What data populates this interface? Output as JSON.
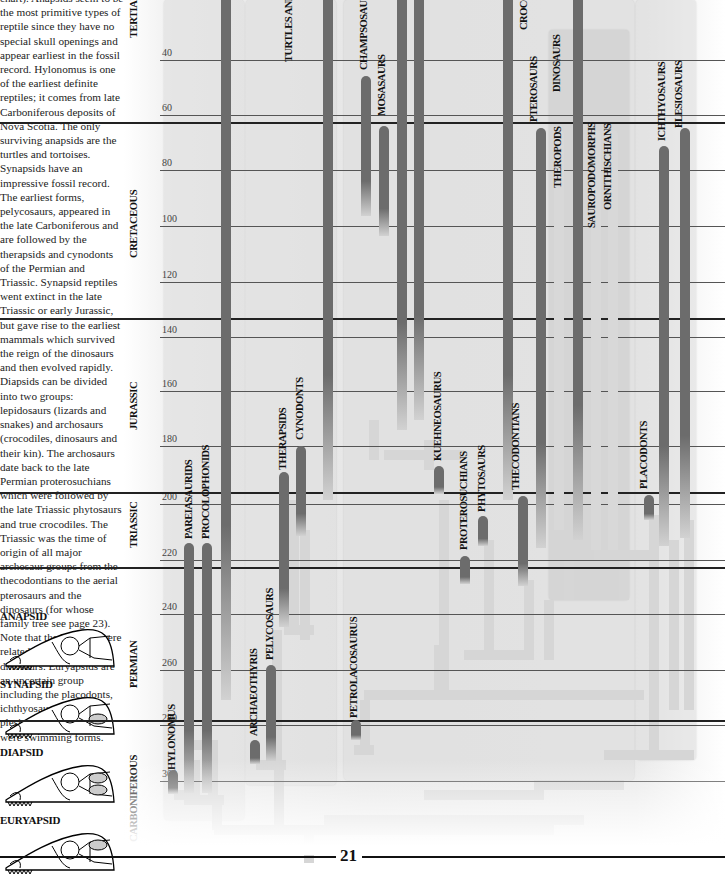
{
  "text": {
    "paragraphs": [
      "chart). Anapsids seem to be the most primitive types of reptile since they have no special skull openings and appear earliest in the fossil record. Hylonomus is one of the earliest definite reptiles; it comes from late Carboniferous deposits of Nova Scotia. The only surviving anapsids are the turtles and tortoises. Synapsids have an impressive fossil record. The earliest forms, pelycosaurs, appeared in the late Carboniferous and are followed by the therapsids and cynodonts of the Permian and Triassic. Synapsid reptiles went extinct in the late Triassic or early Jurassic, but gave rise to the earliest mammals which survived the reign of the dinosaurs and then evolved rapidly. Diapsids can be divided into two groups: lepidosaurs (lizards and snakes) and archosaurs (crocodiles, dinosaurs and their kin). The archosaurs date back to the late Permian proterosuchians which were followed by the late Triassic phytosaurs and true crocodiles. The Triassic was the time of origin of all major archosaur groups from the thecodontians to the aerial pterosaurs and the dinosaurs (for whose family tree see page 23). Note that the birds are here related to theropod dinosaurs. Euryapsids are an uncertain group including the placodonts, ichthyosaurs, and plesiosaurs, all of which were swimming forms."
    ]
  },
  "skulls": [
    {
      "label": "ANAPSID",
      "openings": 0
    },
    {
      "label": "SYNAPSID",
      "openings": 1
    },
    {
      "label": "DIAPSID",
      "openings": 2
    },
    {
      "label": "EURYAPSID",
      "openings": 1
    }
  ],
  "periods": [
    {
      "label": "TERTIARY",
      "y": 38
    },
    {
      "label": "CRETACEOUS",
      "y": 258
    },
    {
      "label": "JURASSIC",
      "y": 430
    },
    {
      "label": "TRIASSIC",
      "y": 548
    },
    {
      "label": "PERMIAN",
      "y": 688
    },
    {
      "label": "CARBONIFEROUS",
      "y": 842
    }
  ],
  "ticks": [
    {
      "label": "40",
      "y": 56
    },
    {
      "label": "60",
      "y": 111
    },
    {
      "label": "80",
      "y": 166
    },
    {
      "label": "100",
      "y": 222
    },
    {
      "label": "120",
      "y": 278
    },
    {
      "label": "140",
      "y": 333
    },
    {
      "label": "160",
      "y": 387
    },
    {
      "label": "180",
      "y": 442
    },
    {
      "label": "200",
      "y": 500
    },
    {
      "label": "220",
      "y": 556
    },
    {
      "label": "240",
      "y": 610
    },
    {
      "label": "260",
      "y": 666
    },
    {
      "label": "280",
      "y": 721
    },
    {
      "label": "300",
      "y": 777
    }
  ],
  "period_boundaries": [
    122,
    318,
    492,
    567,
    720
  ],
  "taxa": [
    {
      "label": "TURTLES AND",
      "x": 165,
      "labelTop": 62
    },
    {
      "label": "HYLONOMUS",
      "x": 48,
      "labelTop": 770
    },
    {
      "label": "PAREIASAURIDS",
      "x": 65,
      "labelTop": 539
    },
    {
      "label": "PROCOLOPHONIDS",
      "x": 82,
      "labelTop": 539
    },
    {
      "label": "ARCHAEOTHYRIS",
      "x": 130,
      "labelTop": 736
    },
    {
      "label": "PELYCOSAURS",
      "x": 146,
      "labelTop": 660
    },
    {
      "label": "THERAPSIDS",
      "x": 159,
      "labelTop": 470
    },
    {
      "label": "CYNODONTS",
      "x": 176,
      "labelTop": 440
    },
    {
      "label": "PETROLACOSAURUS",
      "x": 230,
      "labelTop": 718
    },
    {
      "label": "CHAMPSOSAURS",
      "x": 240,
      "labelTop": 70
    },
    {
      "label": "MOSASAURS",
      "x": 258,
      "labelTop": 116
    },
    {
      "label": "KUEHNEOSAURUS",
      "x": 314,
      "labelTop": 461
    },
    {
      "label": "PROTEROSUCHIANS",
      "x": 340,
      "labelTop": 550
    },
    {
      "label": "PHYTOSAURS",
      "x": 358,
      "labelTop": 512
    },
    {
      "label": "THECODONTIANS",
      "x": 392,
      "labelTop": 490
    },
    {
      "label": "CROCODILES",
      "x": 400,
      "labelTop": 30
    },
    {
      "label": "PTEROSAURS",
      "x": 410,
      "labelTop": 122
    },
    {
      "label": "DINOSAURS",
      "x": 433,
      "labelTop": 92
    },
    {
      "label": "THEROPODS",
      "x": 434,
      "labelTop": 188
    },
    {
      "label": "SAUROPODOMORPHS",
      "x": 468,
      "labelTop": 228
    },
    {
      "label": "ORNITHISCHIANS",
      "x": 484,
      "labelTop": 210
    },
    {
      "label": "PLACODONTS",
      "x": 520,
      "labelTop": 489
    },
    {
      "label": "ICHTHYOSAURS",
      "x": 538,
      "labelTop": 141
    },
    {
      "label": "PLESIOSAURS",
      "x": 555,
      "labelTop": 128
    }
  ],
  "bars": [
    {
      "name": "turtles",
      "x": 97,
      "top": 0,
      "height": 700,
      "style": "dark"
    },
    {
      "name": "hylonomus",
      "x": 44,
      "top": 770,
      "height": 24,
      "style": "dark"
    },
    {
      "name": "pareiasaurids",
      "x": 60,
      "top": 543,
      "height": 250,
      "style": "dark"
    },
    {
      "name": "procolophonids",
      "x": 78,
      "top": 543,
      "height": 250,
      "style": "dark"
    },
    {
      "name": "archaeothyris",
      "x": 126,
      "top": 740,
      "height": 24,
      "style": "dark"
    },
    {
      "name": "pelycosaurs",
      "x": 142,
      "top": 665,
      "height": 96,
      "style": "dark"
    },
    {
      "name": "therapsids",
      "x": 155,
      "top": 472,
      "height": 155,
      "style": "dark"
    },
    {
      "name": "cynodonts",
      "x": 172,
      "top": 446,
      "height": 90,
      "style": "dark"
    },
    {
      "name": "synapsid-stem",
      "x": 199,
      "top": 0,
      "height": 500,
      "style": "dark"
    },
    {
      "name": "petrolacosaurus",
      "x": 227,
      "top": 720,
      "height": 20,
      "style": "dark"
    },
    {
      "name": "champsosaurs",
      "x": 237,
      "top": 76,
      "height": 140,
      "style": "dark"
    },
    {
      "name": "mosasaurs",
      "x": 255,
      "top": 126,
      "height": 110,
      "style": "dark"
    },
    {
      "name": "lepidosaur-1",
      "x": 273,
      "top": 0,
      "height": 430,
      "style": "dark"
    },
    {
      "name": "lepidosaur-2",
      "x": 290,
      "top": 0,
      "height": 420,
      "style": "dark"
    },
    {
      "name": "kuehneosaurus",
      "x": 310,
      "top": 466,
      "height": 28,
      "style": "dark"
    },
    {
      "name": "proterosuchians",
      "x": 336,
      "top": 556,
      "height": 28,
      "style": "dark"
    },
    {
      "name": "phytosaurs",
      "x": 354,
      "top": 516,
      "height": 30,
      "style": "dark"
    },
    {
      "name": "crocodiles",
      "x": 379,
      "top": 0,
      "height": 500,
      "style": "dark"
    },
    {
      "name": "thecodontians",
      "x": 394,
      "top": 496,
      "height": 90,
      "style": "dark"
    },
    {
      "name": "pterosaurs",
      "x": 412,
      "top": 128,
      "height": 420,
      "style": "dark"
    },
    {
      "name": "theropods",
      "x": 430,
      "top": 130,
      "height": 400,
      "style": "light"
    },
    {
      "name": "birds",
      "x": 449,
      "top": 0,
      "height": 540,
      "style": "dark"
    },
    {
      "name": "sauropodomorphs",
      "x": 467,
      "top": 130,
      "height": 420,
      "style": "light"
    },
    {
      "name": "ornithischians",
      "x": 484,
      "top": 130,
      "height": 420,
      "style": "light"
    },
    {
      "name": "placodonts",
      "x": 520,
      "top": 495,
      "height": 25,
      "style": "dark"
    },
    {
      "name": "ichthyosaurs",
      "x": 535,
      "top": 146,
      "height": 400,
      "style": "dark"
    },
    {
      "name": "plesiosaurs",
      "x": 556,
      "top": 128,
      "height": 410,
      "style": "dark"
    }
  ],
  "footer": {
    "page_number": "21"
  }
}
